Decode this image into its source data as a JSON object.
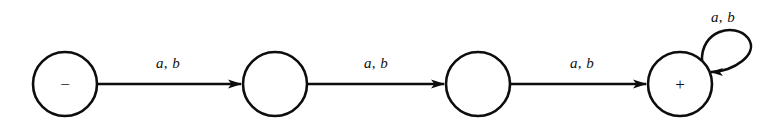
{
  "figure": {
    "background_color": "#ffffff",
    "stroke_color": "#0d0d0d",
    "states": [
      {
        "id": "q0",
        "mark": "−",
        "cx": 65,
        "cy": 84,
        "r": 32,
        "role": "start-reject"
      },
      {
        "id": "q1",
        "mark": "",
        "cx": 275,
        "cy": 84,
        "r": 32,
        "role": "intermediate"
      },
      {
        "id": "q2",
        "mark": "",
        "cx": 478,
        "cy": 84,
        "r": 32,
        "role": "intermediate"
      },
      {
        "id": "q3",
        "mark": "+",
        "cx": 680,
        "cy": 84,
        "r": 32,
        "role": "accept"
      }
    ],
    "transitions": [
      {
        "from": "q0",
        "to": "q1",
        "label": "a, b",
        "label_x": 168,
        "label_y": 68
      },
      {
        "from": "q1",
        "to": "q2",
        "label": "a, b",
        "label_x": 376,
        "label_y": 68
      },
      {
        "from": "q2",
        "to": "q3",
        "label": "a, b",
        "label_x": 582,
        "label_y": 68
      }
    ],
    "self_loops": [
      {
        "on": "q3",
        "label": "a, b",
        "label_x": 723,
        "label_y": 22
      }
    ]
  }
}
